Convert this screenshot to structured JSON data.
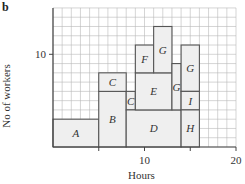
{
  "panel_label": "b",
  "chart_data": {
    "type": "gantt-area-diagram",
    "title": "",
    "xlabel": "Hours",
    "ylabel": "No of workers",
    "xlim": [
      0,
      20
    ],
    "ylim": [
      0,
      15
    ],
    "x_ticks": [
      {
        "value": 10,
        "label": "10"
      },
      {
        "value": 20,
        "label": "20"
      }
    ],
    "y_ticks": [
      {
        "value": 10,
        "label": "10"
      }
    ],
    "grid": true,
    "blocks": [
      {
        "label": "A",
        "x0": 0,
        "x1": 5,
        "y0": 0,
        "y1": 3
      },
      {
        "label": "B",
        "x0": 5,
        "x1": 8,
        "y0": 0,
        "y1": 6
      },
      {
        "label": "C",
        "x0": 5,
        "x1": 8,
        "y0": 6,
        "y1": 8
      },
      {
        "label": "C",
        "x0": 8,
        "x1": 9,
        "y0": 4,
        "y1": 6
      },
      {
        "label": "D",
        "x0": 8,
        "x1": 14,
        "y0": 0,
        "y1": 4
      },
      {
        "label": "E",
        "x0": 9,
        "x1": 13,
        "y0": 4,
        "y1": 8
      },
      {
        "label": "F",
        "x0": 9,
        "x1": 11,
        "y0": 8,
        "y1": 11
      },
      {
        "label": "G",
        "x0": 11,
        "x1": 13,
        "y0": 8,
        "y1": 13
      },
      {
        "label": "G",
        "x0": 13,
        "x1": 14,
        "y0": 4,
        "y1": 9
      },
      {
        "label": "G",
        "x0": 14,
        "x1": 16,
        "y0": 6,
        "y1": 11
      },
      {
        "label": "I",
        "x0": 14,
        "x1": 16,
        "y0": 4,
        "y1": 6
      },
      {
        "label": "H",
        "x0": 14,
        "x1": 16,
        "y0": 0,
        "y1": 4
      }
    ]
  },
  "colors": {
    "grid": "#b8b8b8",
    "axis": "#444444",
    "block_fill": "#efefef",
    "block_stroke": "#555555",
    "text": "#333333"
  }
}
